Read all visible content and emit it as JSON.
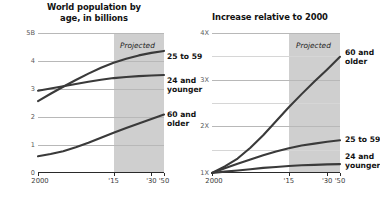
{
  "figure": {
    "width": 375,
    "height": 202,
    "background": "#ffffff",
    "projected_band_color": "#cfcfcf",
    "line_color": "#3a3a3a",
    "grid_color": "#b8b8b8"
  },
  "panels": [
    {
      "id": "left",
      "title": "World population by\nage, in billions",
      "title_line1": "World population by",
      "title_line2": "age, in billions",
      "projected_label": "Projected",
      "series_labels": [
        {
          "name": "25 to 59",
          "line1": "25 to 59",
          "line2": ""
        },
        {
          "name": "24 and younger",
          "line1": "24 and",
          "line2": "younger"
        },
        {
          "name": "60 and older",
          "line1": "60 and",
          "line2": "older"
        }
      ]
    },
    {
      "id": "right",
      "title": "Increase relative to 2000",
      "title_line1": "Increase relative to 2000",
      "title_line2": "",
      "projected_label": "Projected",
      "series_labels": [
        {
          "name": "60 and older",
          "line1": "60 and",
          "line2": "older"
        },
        {
          "name": "25 to 59",
          "line1": "25 to 59",
          "line2": ""
        },
        {
          "name": "24 and younger",
          "line1": "24 and",
          "line2": "younger"
        }
      ]
    }
  ],
  "chart_data": [
    {
      "type": "line",
      "id": "world-population-by-age",
      "title": "World population by age, in billions",
      "xlabel": "",
      "ylabel": "",
      "x": [
        2000,
        2005,
        2010,
        2015,
        2020,
        2025,
        2030,
        2035,
        2040,
        2045,
        2050
      ],
      "xlim": [
        2000,
        2050
      ],
      "ylim": [
        0,
        5
      ],
      "xticks": [
        2000,
        2015,
        2030,
        2050
      ],
      "xticklabels": [
        "2000",
        "'15",
        "'30",
        "'50"
      ],
      "yticks": [
        0,
        1,
        2,
        3,
        4,
        5
      ],
      "yticklabels": [
        "0",
        "1",
        "2",
        "3",
        "4",
        "5B"
      ],
      "grid": true,
      "legend": "right-inline",
      "projected_from": 2015,
      "projected_label": "Projected",
      "series": [
        {
          "name": "25 to 59",
          "values": [
            2.57,
            2.83,
            3.08,
            3.32,
            3.55,
            3.76,
            3.94,
            4.08,
            4.2,
            4.29,
            4.36
          ]
        },
        {
          "name": "24 and younger",
          "values": [
            2.94,
            3.02,
            3.1,
            3.18,
            3.26,
            3.33,
            3.39,
            3.43,
            3.46,
            3.48,
            3.5
          ]
        },
        {
          "name": "60 and older",
          "values": [
            0.6,
            0.68,
            0.78,
            0.92,
            1.08,
            1.26,
            1.44,
            1.61,
            1.77,
            1.93,
            2.09
          ]
        }
      ]
    },
    {
      "type": "line",
      "id": "increase-relative-to-2000",
      "title": "Increase relative to 2000",
      "xlabel": "",
      "ylabel": "",
      "x": [
        2000,
        2005,
        2010,
        2015,
        2020,
        2025,
        2030,
        2035,
        2040,
        2045,
        2050
      ],
      "xlim": [
        2000,
        2050
      ],
      "ylim": [
        1,
        4
      ],
      "xticks": [
        2000,
        2015,
        2030,
        2050
      ],
      "xticklabels": [
        "2000",
        "'15",
        "'30",
        "'50"
      ],
      "yticks": [
        1,
        1.5,
        2,
        2.5,
        3,
        3.5,
        4
      ],
      "yticklabels": [
        "1X",
        "",
        "2X",
        "",
        "3X",
        "",
        "4X"
      ],
      "major_yticks": [
        1,
        2,
        3,
        4
      ],
      "major_yticklabels": [
        "1X",
        "2X",
        "3X",
        "4X"
      ],
      "grid": true,
      "legend": "right-inline",
      "projected_from": 2015,
      "projected_label": "Projected",
      "series": [
        {
          "name": "60 and older",
          "values": [
            1.0,
            1.14,
            1.31,
            1.54,
            1.81,
            2.11,
            2.41,
            2.69,
            2.96,
            3.22,
            3.49
          ]
        },
        {
          "name": "25 to 59",
          "values": [
            1.0,
            1.1,
            1.2,
            1.29,
            1.38,
            1.46,
            1.53,
            1.59,
            1.63,
            1.67,
            1.7
          ]
        },
        {
          "name": "24 and younger",
          "values": [
            1.0,
            1.03,
            1.055,
            1.08,
            1.11,
            1.13,
            1.15,
            1.165,
            1.175,
            1.185,
            1.19
          ]
        }
      ]
    }
  ]
}
